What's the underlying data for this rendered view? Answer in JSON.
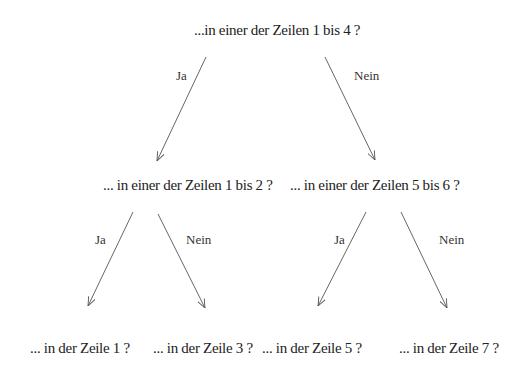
{
  "diagram": {
    "type": "decision-tree",
    "root": {
      "text": "...in einer der Zeilen 1 bis 4 ?"
    },
    "level2": [
      {
        "text": "... in einer der Zeilen 1 bis 2  ?"
      },
      {
        "text": "... in einer der Zeilen 5 bis 6  ?"
      }
    ],
    "leaves": [
      {
        "text": "... in der Zeile 1 ?"
      },
      {
        "text": "... in der Zeile 3 ?"
      },
      {
        "text": "... in der Zeile 5 ?"
      },
      {
        "text": "... in der Zeile 7 ?"
      }
    ],
    "edge_labels": {
      "yes": "Ja",
      "no": "Nein"
    },
    "edges": [
      {
        "from": "root",
        "to": "level2.0",
        "label": "Ja"
      },
      {
        "from": "root",
        "to": "level2.1",
        "label": "Nein"
      },
      {
        "from": "level2.0",
        "to": "leaves.0",
        "label": "Ja"
      },
      {
        "from": "level2.0",
        "to": "leaves.1",
        "label": "Nein"
      },
      {
        "from": "level2.1",
        "to": "leaves.2",
        "label": "Ja"
      },
      {
        "from": "level2.1",
        "to": "leaves.3",
        "label": "Nein"
      }
    ],
    "colors": {
      "line": "#555555",
      "text": "#222222",
      "background": "#ffffff"
    }
  }
}
